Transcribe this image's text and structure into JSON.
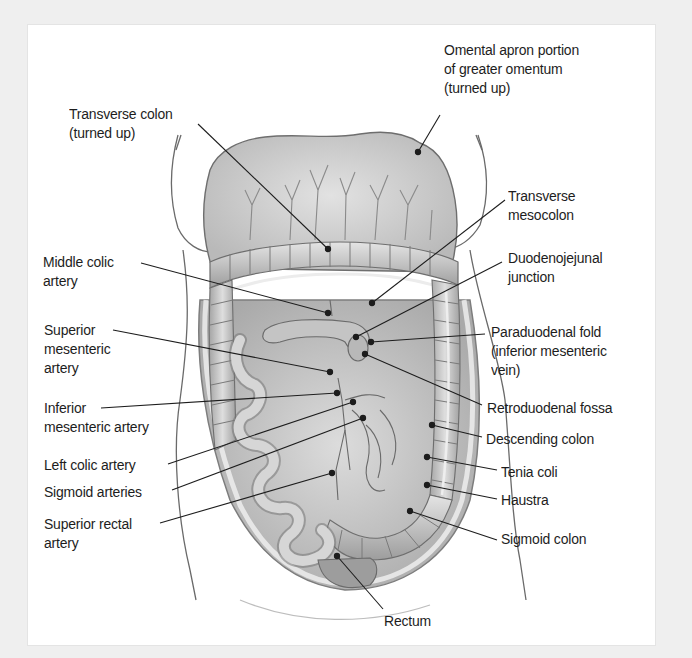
{
  "figure": {
    "colors": {
      "background": "#efefef",
      "panel": "#ffffff",
      "tissue": "#c9c9c9",
      "tissue_dark": "#8e8e8e",
      "line": "#1d1d1d"
    }
  },
  "labels": {
    "transverse_colon": {
      "lines": [
        "Transverse colon",
        "(turned up)"
      ]
    },
    "omental_apron": {
      "lines": [
        "Omental apron portion",
        "of greater omentum",
        "(turned up)"
      ]
    },
    "transverse_mesocolon": {
      "lines": [
        "Transverse",
        "mesocolon"
      ]
    },
    "middle_colic_artery": {
      "lines": [
        "Middle colic",
        "artery"
      ]
    },
    "duodenojejunal_junction": {
      "lines": [
        "Duodenojejunal",
        "junction"
      ]
    },
    "superior_mesenteric_artery": {
      "lines": [
        "Superior",
        "mesenteric",
        "artery"
      ]
    },
    "paraduodenal_fold": {
      "lines": [
        "Paraduodenal fold",
        "(inferior mesenteric",
        "vein)"
      ]
    },
    "inferior_mesenteric_artery": {
      "lines": [
        "Inferior",
        "mesenteric artery"
      ]
    },
    "retroduodenal_fossa": {
      "lines": [
        "Retroduodenal fossa"
      ]
    },
    "descending_colon": {
      "lines": [
        "Descending colon"
      ]
    },
    "left_colic_artery": {
      "lines": [
        "Left colic artery"
      ]
    },
    "tenia_coli": {
      "lines": [
        "Tenia coli"
      ]
    },
    "sigmoid_arteries": {
      "lines": [
        "Sigmoid arteries"
      ]
    },
    "haustra": {
      "lines": [
        "Haustra"
      ]
    },
    "superior_rectal_artery": {
      "lines": [
        "Superior rectal",
        "artery"
      ]
    },
    "sigmoid_colon": {
      "lines": [
        "Sigmoid colon"
      ]
    },
    "rectum": {
      "lines": [
        "Rectum"
      ]
    }
  }
}
